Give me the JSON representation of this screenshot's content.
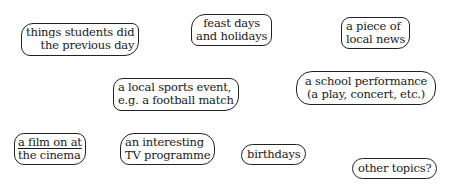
{
  "diagram": {
    "type": "mind-map-bubbles",
    "bubbles": [
      {
        "id": "things",
        "lines": [
          "things students did",
          "the previous day"
        ]
      },
      {
        "id": "feast",
        "lines": [
          "feast days",
          "and holidays"
        ]
      },
      {
        "id": "news",
        "lines": [
          "a piece of",
          "local news"
        ]
      },
      {
        "id": "sports",
        "lines": [
          "a local sports event,",
          "e.g. a football match"
        ]
      },
      {
        "id": "school",
        "lines": [
          "a school performance",
          "(a play, concert, etc.)"
        ]
      },
      {
        "id": "film",
        "lines": [
          "a film on at",
          "the cinema"
        ]
      },
      {
        "id": "tv",
        "lines": [
          "an interesting",
          "TV programme"
        ]
      },
      {
        "id": "birthdays",
        "lines": [
          "birthdays"
        ]
      },
      {
        "id": "other",
        "lines": [
          "other topics?"
        ]
      }
    ]
  }
}
